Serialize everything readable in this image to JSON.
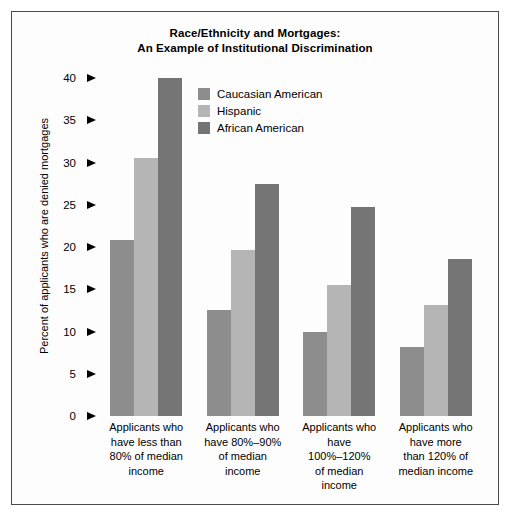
{
  "chart_data": {
    "type": "bar",
    "title": "Race/Ethnicity and Mortgages: An Example of Institutional Discrimination",
    "title_lines": [
      "Race/Ethnicity and Mortgages:",
      "An Example of Institutional Discrimination"
    ],
    "xlabel": "",
    "ylabel": "Percent of applicants who are denied mortgages",
    "ylim": [
      0,
      40
    ],
    "ytick_values": [
      0,
      5,
      10,
      15,
      20,
      25,
      30,
      35,
      40
    ],
    "ytick_labels": [
      "0",
      "5",
      "10",
      "15",
      "20",
      "25",
      "30",
      "35",
      "40"
    ],
    "grid": false,
    "legend_position": "upper-center-inside",
    "categories": [
      "Applicants who have less than 80% of median income",
      "Applicants who have 80%–90% of median income",
      "Applicants who have 100%–120% of median income",
      "Applicants who have more than 120% of median income"
    ],
    "category_lines": [
      [
        "Applicants who",
        "have less than",
        "80% of median",
        "income"
      ],
      [
        "Applicants who",
        "have 80%–90%",
        "of median",
        "income"
      ],
      [
        "Applicants who",
        "have",
        "100%–120%",
        "of median",
        "income"
      ],
      [
        "Applicants who",
        "have more",
        "than 120% of",
        "median income"
      ]
    ],
    "series": [
      {
        "name": "Caucasian American",
        "color": "#8d8d8d",
        "values": [
          20.8,
          12.5,
          10.0,
          8.2
        ]
      },
      {
        "name": "Hispanic",
        "color": "#b5b5b5",
        "values": [
          30.5,
          19.6,
          15.5,
          13.1
        ]
      },
      {
        "name": "African American",
        "color": "#757575",
        "values": [
          40.0,
          27.4,
          24.7,
          18.6
        ]
      }
    ]
  },
  "colors": {
    "background": "#ffffff",
    "frame": "#4a4a4a",
    "text": "#000000"
  }
}
